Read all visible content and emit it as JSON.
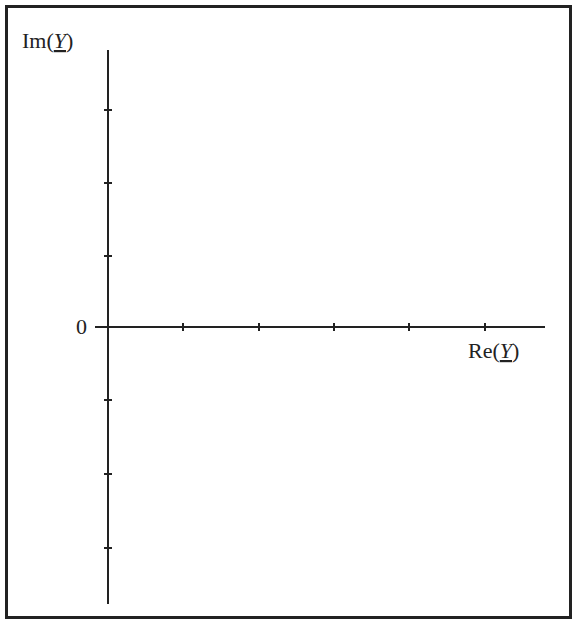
{
  "chart_data": {
    "type": "line",
    "title": "",
    "xlabel": "Re(Y)",
    "ylabel": "Im(Y)",
    "x_label_parts": {
      "prefix": "Re(",
      "var": "Y",
      "suffix": ")"
    },
    "y_label_parts": {
      "prefix": "Im(",
      "var": "Y",
      "suffix": ")"
    },
    "origin_label": "0",
    "x_ticks_count": 5,
    "y_ticks_above_origin": 3,
    "y_ticks_below_origin": 3,
    "tick_labels": [],
    "series": [],
    "grid": false,
    "legend": null,
    "note": "Empty complex-plane axes (admittance plane) with unlabeled tick marks"
  },
  "style": {
    "axis_color": "#222222",
    "frame_color": "#222222",
    "background": "#ffffff"
  },
  "layout": {
    "origin": {
      "x": 108,
      "y": 327
    },
    "x_axis": {
      "start": 95,
      "end": 545
    },
    "y_axis": {
      "start": 50,
      "end": 604
    },
    "x_tick_positions": [
      183,
      259,
      334,
      409,
      485
    ],
    "y_tick_positions": [
      110,
      183,
      256,
      400,
      474,
      548
    ]
  }
}
